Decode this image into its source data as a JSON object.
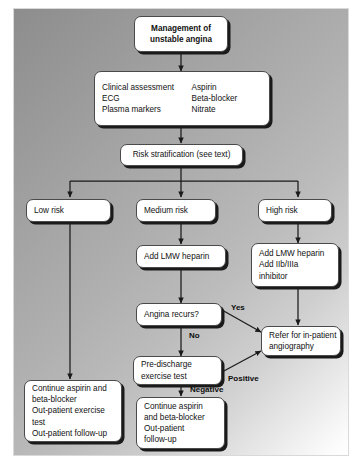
{
  "diagram": {
    "colors": {
      "box_fill": "#ffffff",
      "box_border": "#4a4a4a",
      "box_shadow": "#1a1a1a",
      "connector": "#1a1a1a",
      "panel_gradient_start": "#8d8d8d",
      "panel_gradient_end": "#ffffff"
    },
    "nodes": {
      "start": {
        "line1": "Management of",
        "line2": "unstable angina"
      },
      "assessment": {
        "left": [
          "Clinical assessment",
          "ECG",
          "Plasma markers"
        ],
        "right": [
          "Aspirin",
          "Beta-blocker",
          "Nitrate"
        ]
      },
      "risk_stratification": {
        "label": "Risk stratification (see text)"
      },
      "low_risk": {
        "label": "Low risk"
      },
      "medium_risk": {
        "label": "Medium risk"
      },
      "high_risk": {
        "label": "High risk"
      },
      "medium_heparin": {
        "label": "Add LMW heparin"
      },
      "high_treatment": {
        "lines": [
          "Add LMW heparin",
          "Add IIb/IIIa",
          "inhibitor"
        ]
      },
      "angina_recurs": {
        "label": "Angina recurs?"
      },
      "exercise_test": {
        "lines": [
          "Pre-discharge",
          "exercise test"
        ]
      },
      "angiography": {
        "lines": [
          "Refer for in-patient",
          "angiography"
        ]
      },
      "low_risk_outcome": {
        "lines": [
          "Continue aspirin and",
          "beta-blocker",
          "Out-patient exercise",
          "test",
          "Out-patient follow-up"
        ]
      },
      "medium_risk_outcome": {
        "lines": [
          "Continue aspirin",
          "and beta-blocker",
          "Out-patient",
          "follow-up"
        ]
      }
    },
    "edge_labels": {
      "yes": "Yes",
      "no": "No",
      "positive": "Positive",
      "negative": "Negative"
    }
  }
}
